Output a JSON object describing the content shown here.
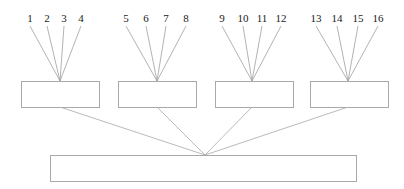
{
  "diagram": {
    "type": "tree-hierarchy",
    "canvas": {
      "width": 404,
      "height": 189,
      "background": "#ffffff"
    },
    "style": {
      "line_color": "#a0a0a0",
      "box_stroke": "#a9a9a9",
      "box_fill": "#ffffff",
      "text_color": "#1a1a1a"
    },
    "leaves": [
      {
        "label": "1",
        "x": 30,
        "y": 18
      },
      {
        "label": "2",
        "x": 47,
        "y": 18
      },
      {
        "label": "3",
        "x": 64,
        "y": 18
      },
      {
        "label": "4",
        "x": 81,
        "y": 18
      },
      {
        "label": "5",
        "x": 126,
        "y": 18
      },
      {
        "label": "6",
        "x": 146,
        "y": 18
      },
      {
        "label": "7",
        "x": 166,
        "y": 18
      },
      {
        "label": "8",
        "x": 186,
        "y": 18
      },
      {
        "label": "9",
        "x": 222,
        "y": 18
      },
      {
        "label": "10",
        "x": 243,
        "y": 18
      },
      {
        "label": "11",
        "x": 262,
        "y": 18
      },
      {
        "label": "12",
        "x": 281,
        "y": 18
      },
      {
        "label": "13",
        "x": 316,
        "y": 18
      },
      {
        "label": "14",
        "x": 337,
        "y": 18
      },
      {
        "label": "15",
        "x": 358,
        "y": 18
      },
      {
        "label": "16",
        "x": 378,
        "y": 18
      }
    ],
    "mid_boxes": [
      {
        "name": "mid-box-1",
        "label": "",
        "x": 21,
        "y": 81,
        "width": 78,
        "height": 26,
        "apex_x": 60,
        "exit_x": 60
      },
      {
        "name": "mid-box-2",
        "label": "",
        "x": 118,
        "y": 81,
        "width": 78,
        "height": 26,
        "apex_x": 157,
        "exit_x": 157
      },
      {
        "name": "mid-box-3",
        "label": "",
        "x": 215,
        "y": 81,
        "width": 78,
        "height": 26,
        "apex_x": 252,
        "exit_x": 252
      },
      {
        "name": "mid-box-4",
        "label": "",
        "x": 310,
        "y": 81,
        "width": 78,
        "height": 26,
        "apex_x": 348,
        "exit_x": 348
      }
    ],
    "root_box": {
      "name": "root-box",
      "label": "",
      "x": 50,
      "y": 155,
      "width": 306,
      "height": 26
    },
    "convergence_point": {
      "x": 205,
      "y": 155
    },
    "leaf_edges": [
      {
        "from_x": 30,
        "from_y": 26,
        "to_x": 60,
        "to_y": 81
      },
      {
        "from_x": 47,
        "from_y": 26,
        "to_x": 60,
        "to_y": 81
      },
      {
        "from_x": 64,
        "from_y": 26,
        "to_x": 60,
        "to_y": 81
      },
      {
        "from_x": 81,
        "from_y": 26,
        "to_x": 60,
        "to_y": 81
      },
      {
        "from_x": 126,
        "from_y": 26,
        "to_x": 157,
        "to_y": 81
      },
      {
        "from_x": 146,
        "from_y": 26,
        "to_x": 157,
        "to_y": 81
      },
      {
        "from_x": 166,
        "from_y": 26,
        "to_x": 157,
        "to_y": 81
      },
      {
        "from_x": 186,
        "from_y": 26,
        "to_x": 157,
        "to_y": 81
      },
      {
        "from_x": 222,
        "from_y": 26,
        "to_x": 252,
        "to_y": 81
      },
      {
        "from_x": 243,
        "from_y": 26,
        "to_x": 252,
        "to_y": 81
      },
      {
        "from_x": 262,
        "from_y": 26,
        "to_x": 252,
        "to_y": 81
      },
      {
        "from_x": 281,
        "from_y": 26,
        "to_x": 252,
        "to_y": 81
      },
      {
        "from_x": 316,
        "from_y": 26,
        "to_x": 348,
        "to_y": 81
      },
      {
        "from_x": 337,
        "from_y": 26,
        "to_x": 348,
        "to_y": 81
      },
      {
        "from_x": 358,
        "from_y": 26,
        "to_x": 348,
        "to_y": 81
      },
      {
        "from_x": 378,
        "from_y": 26,
        "to_x": 348,
        "to_y": 81
      }
    ],
    "root_edges": [
      {
        "from_x": 60,
        "from_y": 107,
        "to_x": 205,
        "to_y": 155
      },
      {
        "from_x": 157,
        "from_y": 107,
        "to_x": 205,
        "to_y": 155
      },
      {
        "from_x": 252,
        "from_y": 107,
        "to_x": 205,
        "to_y": 155
      },
      {
        "from_x": 348,
        "from_y": 107,
        "to_x": 205,
        "to_y": 155
      }
    ]
  }
}
